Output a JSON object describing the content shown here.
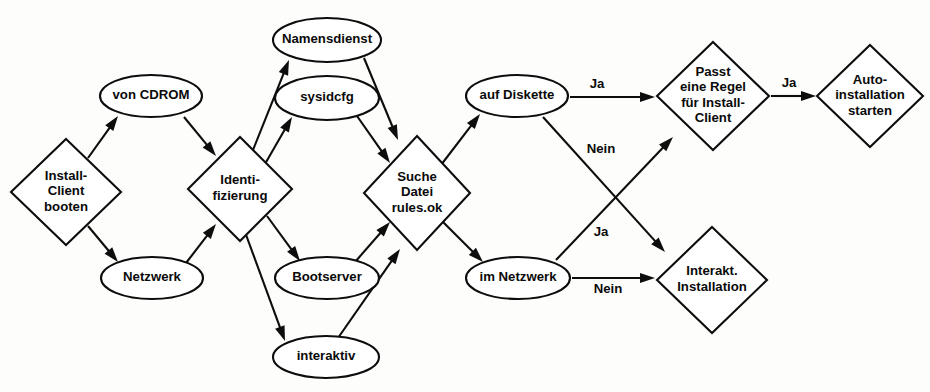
{
  "diagram": {
    "background_color": "#fdfdfb",
    "stroke_color": "#0d0d0d",
    "fill_color": "#ffffff",
    "text_color": "#0a0a0a",
    "width": 930,
    "height": 392,
    "nodes": [
      {
        "id": "install-client-booten",
        "shape": "diamond",
        "label": "Install-\nClient\nbooten",
        "lines": [
          "Install-",
          "Client",
          "booten"
        ],
        "cx": 66,
        "cy": 192,
        "rx": 55,
        "ry": 53
      },
      {
        "id": "von-cdrom",
        "shape": "ellipse",
        "label": "von CDROM",
        "lines": [
          "von CDROM"
        ],
        "cx": 151,
        "cy": 96,
        "rx": 51,
        "ry": 21
      },
      {
        "id": "netzwerk",
        "shape": "ellipse",
        "label": "Netzwerk",
        "lines": [
          "Netzwerk"
        ],
        "cx": 152,
        "cy": 278,
        "rx": 51,
        "ry": 21
      },
      {
        "id": "identifizierung",
        "shape": "diamond",
        "label": "Identi-\nfizierung",
        "lines": [
          "Identi-",
          "fizierung"
        ],
        "cx": 240,
        "cy": 189,
        "rx": 52,
        "ry": 52
      },
      {
        "id": "namensdienst",
        "shape": "ellipse",
        "label": "Namensdienst",
        "lines": [
          "Namensdienst"
        ],
        "cx": 327,
        "cy": 40,
        "rx": 54,
        "ry": 22
      },
      {
        "id": "sysidcfg",
        "shape": "ellipse",
        "label": "sysidcfg",
        "lines": [
          "sysidcfg"
        ],
        "cx": 327,
        "cy": 98,
        "rx": 52,
        "ry": 22
      },
      {
        "id": "bootserver",
        "shape": "ellipse",
        "label": "Bootserver",
        "lines": [
          "Bootserver"
        ],
        "cx": 327,
        "cy": 278,
        "rx": 52,
        "ry": 21
      },
      {
        "id": "interaktiv",
        "shape": "ellipse",
        "label": "interaktiv",
        "lines": [
          "interaktiv"
        ],
        "cx": 326,
        "cy": 357,
        "rx": 53,
        "ry": 21
      },
      {
        "id": "suche-datei-rules-ok",
        "shape": "diamond",
        "label": "Suche\nDatei\nrules.ok",
        "lines": [
          "Suche",
          "Datei",
          "rules.ok"
        ],
        "cx": 417,
        "cy": 193,
        "rx": 53,
        "ry": 57
      },
      {
        "id": "auf-diskette",
        "shape": "ellipse",
        "label": "auf Diskette",
        "lines": [
          "auf Diskette"
        ],
        "cx": 517,
        "cy": 96,
        "rx": 51,
        "ry": 21
      },
      {
        "id": "im-netzwerk",
        "shape": "ellipse",
        "label": "im Netzwerk",
        "lines": [
          "im Netzwerk"
        ],
        "cx": 518,
        "cy": 278,
        "rx": 52,
        "ry": 21
      },
      {
        "id": "passt-eine-regel",
        "shape": "diamond",
        "label": "Passt\neine Regel\nfür Install-\nClient",
        "lines": [
          "Passt",
          "eine Regel",
          "für Install-",
          "Client"
        ],
        "cx": 713,
        "cy": 96,
        "rx": 56,
        "ry": 54
      },
      {
        "id": "interakt-installation",
        "shape": "diamond",
        "label": "Interakt.\nInstallation",
        "lines": [
          "Interakt.",
          "Installation"
        ],
        "cx": 712,
        "cy": 280,
        "rx": 55,
        "ry": 53
      },
      {
        "id": "auto-installation-starten",
        "shape": "diamond",
        "label": "Auto-\ninstallation\nstarten",
        "lines": [
          "Auto-",
          "installation",
          "starten"
        ],
        "cx": 870,
        "cy": 96,
        "rx": 53,
        "ry": 51
      }
    ],
    "edges": [
      {
        "id": "e1",
        "from": "install-client-booten",
        "to": "von-cdrom",
        "label": "",
        "x1": 88,
        "y1": 158,
        "x2": 118,
        "y2": 116
      },
      {
        "id": "e2",
        "from": "install-client-booten",
        "to": "netzwerk",
        "label": "",
        "x1": 88,
        "y1": 226,
        "x2": 118,
        "y2": 262
      },
      {
        "id": "e3",
        "from": "von-cdrom",
        "to": "identifizierung",
        "label": "",
        "x1": 184,
        "y1": 117,
        "x2": 216,
        "y2": 156
      },
      {
        "id": "e4",
        "from": "netzwerk",
        "to": "identifizierung",
        "label": "",
        "x1": 186,
        "y1": 263,
        "x2": 216,
        "y2": 224
      },
      {
        "id": "e5",
        "from": "identifizierung",
        "to": "namensdienst",
        "label": "",
        "x1": 251,
        "y1": 155,
        "x2": 289,
        "y2": 60
      },
      {
        "id": "e6",
        "from": "identifizierung",
        "to": "sysidcfg",
        "label": "",
        "x1": 265,
        "y1": 164,
        "x2": 292,
        "y2": 117
      },
      {
        "id": "e7",
        "from": "identifizierung",
        "to": "bootserver",
        "label": "",
        "x1": 267,
        "y1": 216,
        "x2": 300,
        "y2": 261
      },
      {
        "id": "e8",
        "from": "identifizierung",
        "to": "interaktiv",
        "label": "",
        "x1": 245,
        "y1": 232,
        "x2": 285,
        "y2": 341
      },
      {
        "id": "e9",
        "from": "namensdienst",
        "to": "suche-datei-rules-ok",
        "label": "",
        "x1": 364,
        "y1": 58,
        "x2": 398,
        "y2": 140
      },
      {
        "id": "e10",
        "from": "sysidcfg",
        "to": "suche-datei-rules-ok",
        "label": "",
        "x1": 357,
        "y1": 116,
        "x2": 390,
        "y2": 163
      },
      {
        "id": "e11",
        "from": "bootserver",
        "to": "suche-datei-rules-ok",
        "label": "",
        "x1": 355,
        "y1": 262,
        "x2": 390,
        "y2": 222
      },
      {
        "id": "e12",
        "from": "interaktiv",
        "to": "suche-datei-rules-ok",
        "label": "",
        "x1": 338,
        "y1": 338,
        "x2": 400,
        "y2": 249
      },
      {
        "id": "e13",
        "from": "suche-datei-rules-ok",
        "to": "auf-diskette",
        "label": "",
        "x1": 441,
        "y1": 165,
        "x2": 480,
        "y2": 114
      },
      {
        "id": "e14",
        "from": "suche-datei-rules-ok",
        "to": "im-netzwerk",
        "label": "",
        "x1": 443,
        "y1": 222,
        "x2": 483,
        "y2": 262
      },
      {
        "id": "e15",
        "from": "auf-diskette",
        "to": "passt-eine-regel",
        "label": "Ja",
        "lx": 597,
        "ly": 85,
        "x1": 570,
        "y1": 97,
        "x2": 655,
        "y2": 97
      },
      {
        "id": "e16",
        "from": "auf-diskette",
        "to": "interakt-installation",
        "label": "Nein",
        "lx": 601,
        "ly": 150,
        "x1": 543,
        "y1": 117,
        "x2": 665,
        "y2": 252
      },
      {
        "id": "e17",
        "from": "im-netzwerk",
        "to": "passt-eine-regel",
        "label": "Ja",
        "lx": 601,
        "ly": 233,
        "x1": 556,
        "y1": 260,
        "x2": 673,
        "y2": 137
      },
      {
        "id": "e18",
        "from": "im-netzwerk",
        "to": "interakt-installation",
        "label": "Nein",
        "lx": 608,
        "ly": 290,
        "x1": 572,
        "y1": 278,
        "x2": 655,
        "y2": 278
      },
      {
        "id": "e19",
        "from": "passt-eine-regel",
        "to": "auto-installation-starten",
        "label": "Ja",
        "lx": 789,
        "ly": 84,
        "x1": 771,
        "y1": 96,
        "x2": 816,
        "y2": 96
      }
    ]
  }
}
